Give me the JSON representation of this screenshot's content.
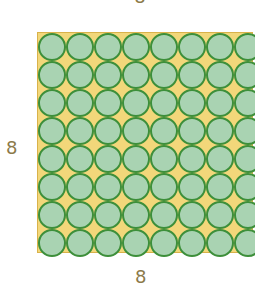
{
  "labels": {
    "top": "8",
    "left": "8",
    "bottom": "8"
  },
  "grid": {
    "rows": 8,
    "cols": 8
  },
  "colors": {
    "background": "#f2d77a",
    "circle_fill": "#a9d3b2",
    "circle_stroke": "#3d8f3a",
    "label": "#8c7a4a"
  }
}
